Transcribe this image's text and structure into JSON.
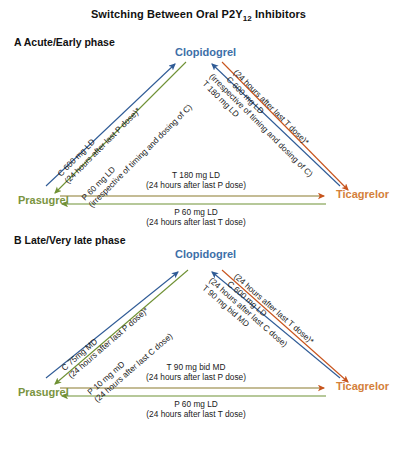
{
  "title": {
    "prefix": "Switching Between Oral P2Y",
    "sub": "12",
    "suffix": " Inhibitors"
  },
  "panels": [
    {
      "id": "A",
      "label": "A Acute/Early phase",
      "nodes": {
        "top": "Clopidogrel",
        "left": "Prasugrel",
        "right": "Ticagrelor"
      },
      "arrows": {
        "prasugrel_to_clopidogrel": {
          "line1": "C 600 mg LD",
          "line2": "(24 hours after last P dose)*"
        },
        "clopidogrel_to_prasugrel": {
          "line1": "P 60 mg LD",
          "line2": "(irrespective of timing and dosing of C)"
        },
        "ticagrelor_to_clopidogrel": {
          "line1": "C 600 mg LD",
          "line2": "(24 hours after last T dose)*"
        },
        "clopidogrel_to_ticagrelor": {
          "line1": "T 180 mg LD",
          "line2": "(irrespective of timing and dosing of C)"
        },
        "prasugrel_to_ticagrelor": {
          "line1": "T 180 mg LD",
          "line2": "(24 hours after last P dose)"
        },
        "ticagrelor_to_prasugrel": {
          "line1": "P 60 mg LD",
          "line2": "(24 hours after last T dose)"
        }
      }
    },
    {
      "id": "B",
      "label": "B Late/Very late phase",
      "nodes": {
        "top": "Clopidogrel",
        "left": "Prasugrel",
        "right": "Ticagrelor"
      },
      "arrows": {
        "prasugrel_to_clopidogrel": {
          "line1": "C 75mg MD",
          "line2": "(24 hours after last P dose)*"
        },
        "clopidogrel_to_prasugrel": {
          "line1": "P 10 mg mD",
          "line2": "(24 hours after last C dose)"
        },
        "ticagrelor_to_clopidogrel": {
          "line1": "C 600 mg LD",
          "line2": "(24 hours after last T dose)*"
        },
        "clopidogrel_to_ticagrelor": {
          "line1": "T 90 mg bid MD",
          "line2": "(24 hours after last C dose)"
        },
        "prasugrel_to_ticagrelor": {
          "line1": "T 90 mg bid MD",
          "line2": "(24 hours after last P dose)"
        },
        "ticagrelor_to_prasugrel": {
          "line1": "P 60 mg LD",
          "line2": "(24 hours after last T dose)"
        }
      }
    }
  ],
  "colors": {
    "clopidogrel": "#3d6fa8",
    "prasugrel": "#7a9440",
    "ticagrelor": "#c8622a",
    "text": "#1a1a1a",
    "background": "#ffffff"
  }
}
